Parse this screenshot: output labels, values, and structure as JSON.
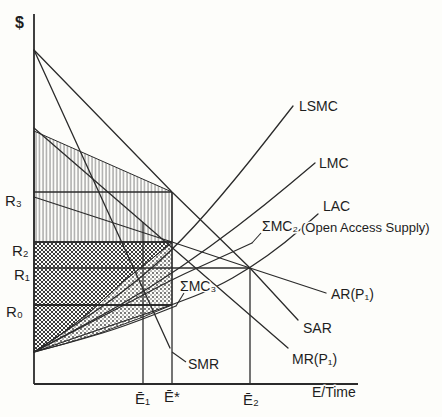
{
  "figure": {
    "kind": "economics-line-figure",
    "background": "#fdfdfa",
    "ink_color": "#2b2b2b",
    "hatch_color": "#8f8f8f",
    "dark_hatch_color": "#3c3c3c",
    "dot_color": "#3c3c3c",
    "width": 442,
    "height": 417
  },
  "chart_data": {
    "type": "line",
    "title": "",
    "xlabel": "E/Time",
    "ylabel": "$",
    "grid": false,
    "units": "pixel coordinates of 442x417 canvas; conceptual diagram (no numeric scale shown)",
    "axes": {
      "y_axis": [
        [
          34,
          14
        ],
        [
          34,
          384
        ]
      ],
      "x_axis": [
        [
          34,
          384
        ],
        [
          358,
          384
        ]
      ]
    },
    "y_ticks": [
      {
        "label": "R₃",
        "y": 192
      },
      {
        "label": "R₂",
        "y": 242
      },
      {
        "label": "R₁",
        "y": 268
      },
      {
        "label": "R₀",
        "y": 305
      }
    ],
    "x_ticks": [
      {
        "label": "Ē₁",
        "x": 143
      },
      {
        "label": "Ē*",
        "x": 172
      },
      {
        "label": "Ē₂",
        "x": 250
      }
    ],
    "ref_lines": [
      {
        "name": "r3-line",
        "points": [
          [
            34,
            192
          ],
          [
            172,
            192
          ]
        ],
        "width": 1.5
      },
      {
        "name": "r2-line",
        "points": [
          [
            34,
            242
          ],
          [
            172,
            242
          ]
        ],
        "width": 1.5
      },
      {
        "name": "r1-line",
        "points": [
          [
            34,
            268
          ],
          [
            250,
            268
          ]
        ],
        "width": 1.5
      },
      {
        "name": "r0-line",
        "points": [
          [
            34,
            305
          ],
          [
            172,
            305
          ]
        ],
        "width": 2
      },
      {
        "name": "e1-line",
        "points": [
          [
            143,
            222
          ],
          [
            143,
            384
          ]
        ],
        "width": 1.3
      },
      {
        "name": "estar-line",
        "points": [
          [
            172,
            192
          ],
          [
            172,
            384
          ]
        ],
        "width": 1.3
      },
      {
        "name": "e2-line",
        "points": [
          [
            250,
            268
          ],
          [
            250,
            384
          ]
        ],
        "width": 1.3
      }
    ],
    "regions": [
      {
        "name": "rent-area-hatched",
        "pattern": "vhatch",
        "points": [
          [
            34,
            131
          ],
          [
            172,
            192
          ],
          [
            172,
            242
          ],
          [
            34,
            242
          ]
        ]
      },
      {
        "name": "rent-area-dark",
        "pattern": "xhatch",
        "points": [
          [
            34,
            242
          ],
          [
            172,
            242
          ],
          [
            160,
            252
          ],
          [
            143,
            266
          ],
          [
            125,
            280
          ],
          [
            90,
            312
          ],
          [
            60,
            335
          ],
          [
            34,
            352
          ]
        ]
      },
      {
        "name": "rent-area-dotted",
        "pattern": "dots",
        "points": [
          [
            34,
            352
          ],
          [
            60,
            335
          ],
          [
            90,
            312
          ],
          [
            125,
            280
          ],
          [
            143,
            266
          ],
          [
            160,
            252
          ],
          [
            172,
            243
          ],
          [
            172,
            305
          ],
          [
            143,
            317
          ],
          [
            100,
            333
          ],
          [
            64,
            344
          ]
        ]
      }
    ],
    "curves": [
      {
        "name": "curve-lsmc",
        "label": "LSMC",
        "points": [
          [
            34,
            352
          ],
          [
            80,
            322
          ],
          [
            130,
            287
          ],
          [
            180,
            243
          ],
          [
            235,
            180
          ],
          [
            293,
            106
          ]
        ]
      },
      {
        "name": "curve-lmc",
        "label": "LMC",
        "points": [
          [
            34,
            352
          ],
          [
            90,
            322
          ],
          [
            150,
            288
          ],
          [
            210,
            247
          ],
          [
            265,
            205
          ],
          [
            315,
            163
          ]
        ]
      },
      {
        "name": "curve-sigma-mc2",
        "label": "ΣMC₂",
        "points": [
          [
            34,
            352
          ],
          [
            80,
            328
          ],
          [
            130,
            302
          ],
          [
            175,
            278
          ],
          [
            215,
            260
          ],
          [
            252,
            243
          ]
        ]
      },
      {
        "name": "curve-lac",
        "label": "LAC (Open Access Supply)",
        "points": [
          [
            34,
            352
          ],
          [
            80,
            336
          ],
          [
            130,
            319
          ],
          [
            172,
            305
          ],
          [
            215,
            288
          ],
          [
            250,
            268
          ],
          [
            285,
            243
          ],
          [
            318,
            214
          ]
        ]
      },
      {
        "name": "curve-sigma-mc3",
        "label": "ΣMC₃",
        "points": [
          [
            34,
            352
          ],
          [
            80,
            340
          ],
          [
            125,
            326
          ],
          [
            176,
            306
          ]
        ]
      }
    ],
    "lines": [
      {
        "name": "line-sar",
        "label": "SAR",
        "points": [
          [
            34,
            50
          ],
          [
            172,
            192
          ],
          [
            250,
            268
          ],
          [
            298,
            320
          ]
        ]
      },
      {
        "name": "line-smr",
        "label": "SMR",
        "points": [
          [
            34,
            50
          ],
          [
            170,
            348
          ]
        ]
      },
      {
        "name": "line-mr",
        "label": "MR(P₁)",
        "points": [
          [
            34,
            128
          ],
          [
            288,
            348
          ]
        ]
      },
      {
        "name": "line-ar",
        "label": "AR(P₁)",
        "points": [
          [
            34,
            197
          ],
          [
            172,
            242
          ],
          [
            250,
            268
          ],
          [
            326,
            293
          ]
        ]
      }
    ],
    "leaders": [
      {
        "name": "leader-smr",
        "points": [
          [
            172,
            352
          ],
          [
            186,
            362
          ]
        ]
      },
      {
        "name": "leader-sigma-mc2",
        "points": [
          [
            252,
            243
          ],
          [
            261,
            233
          ]
        ]
      },
      {
        "name": "leader-sigma-mc3",
        "points": [
          [
            176,
            306
          ],
          [
            184,
            293
          ]
        ]
      }
    ],
    "labels": [
      {
        "name": "y-axis-title",
        "text": "$",
        "x": 15,
        "y": 28,
        "size": 16,
        "weight": "700"
      },
      {
        "name": "tick-r3",
        "text": "R₃",
        "x": 5,
        "y": 206,
        "size": 15
      },
      {
        "name": "tick-r2",
        "text": "R₂",
        "x": 12,
        "y": 256,
        "size": 15
      },
      {
        "name": "tick-r1",
        "text": "R₁",
        "x": 14,
        "y": 280,
        "size": 15
      },
      {
        "name": "tick-r0",
        "text": "R₀",
        "x": 6,
        "y": 317,
        "size": 15
      },
      {
        "name": "tick-e1",
        "text": "Ē₁",
        "x": 135,
        "y": 404,
        "size": 15
      },
      {
        "name": "tick-estar",
        "text": "Ē*",
        "x": 164,
        "y": 402,
        "size": 15
      },
      {
        "name": "tick-e2",
        "text": "Ē₂",
        "x": 243,
        "y": 405,
        "size": 15
      },
      {
        "name": "x-axis-title",
        "text": "E/Time",
        "x": 312,
        "y": 397,
        "size": 14
      },
      {
        "name": "label-lsmc",
        "text": "LSMC",
        "x": 299,
        "y": 111,
        "size": 14
      },
      {
        "name": "label-lmc",
        "text": "LMC",
        "x": 319,
        "y": 168,
        "size": 14
      },
      {
        "name": "label-lac",
        "text": "LAC",
        "x": 323,
        "y": 211,
        "size": 14
      },
      {
        "name": "label-open-access",
        "text": "(Open Access Supply)",
        "x": 301,
        "y": 232,
        "size": 13
      },
      {
        "name": "label-sigma-mc2",
        "text": "ΣMC₂",
        "x": 262,
        "y": 231,
        "size": 14
      },
      {
        "name": "label-ar",
        "text": "AR(P₁)",
        "x": 331,
        "y": 299,
        "size": 14
      },
      {
        "name": "label-sar",
        "text": "SAR",
        "x": 303,
        "y": 333,
        "size": 14
      },
      {
        "name": "label-mr",
        "text": "MR(P₁)",
        "x": 292,
        "y": 364,
        "size": 14
      },
      {
        "name": "label-sigma-mc3",
        "text": "ΣMC₃",
        "x": 180,
        "y": 291,
        "size": 14
      },
      {
        "name": "label-smr",
        "text": "SMR",
        "x": 188,
        "y": 369,
        "size": 14
      }
    ]
  }
}
